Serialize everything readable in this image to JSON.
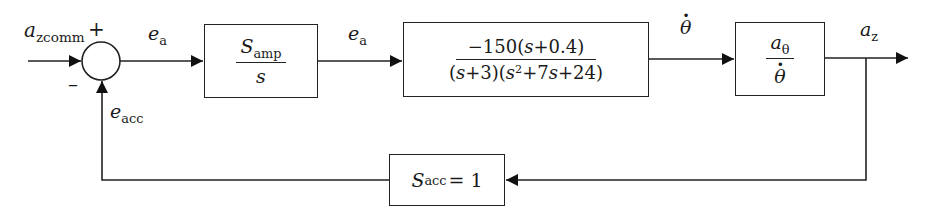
{
  "diagram": {
    "type": "feedback-control-block-diagram",
    "input": {
      "symbol": "a",
      "subscript": "zcomm"
    },
    "summing_junction": {
      "plus_sign": "+",
      "minus_sign": "–"
    },
    "signals": {
      "error_after_sum": {
        "symbol": "e",
        "subscript": "a"
      },
      "error_after_amp": {
        "symbol": "e",
        "subscript": "a"
      },
      "pitch_rate": {
        "symbol": "θ"
      },
      "output": {
        "symbol": "a",
        "subscript": "z"
      },
      "feedback": {
        "symbol": "e",
        "subscript": "acc"
      }
    },
    "blocks": {
      "amplifier": {
        "numerator_symbol": "S",
        "numerator_subscript": "amp",
        "denominator": "s"
      },
      "airframe": {
        "numerator_coef": "−150(",
        "numerator_var": "s",
        "numerator_rest": "+0.4)",
        "denominator_p1": "(",
        "denominator_v1": "s",
        "denominator_p2": "+3)(",
        "denominator_v2": "s",
        "denominator_exp": "2",
        "denominator_p3": "+7",
        "denominator_v3": "s",
        "denominator_p4": "+24)"
      },
      "kinematics": {
        "numerator_symbol": "a",
        "numerator_subscript": "θ",
        "denominator_symbol": "θ"
      },
      "accelerometer": {
        "symbol": "S",
        "subscript": "acc",
        "equals": "= 1"
      }
    }
  }
}
